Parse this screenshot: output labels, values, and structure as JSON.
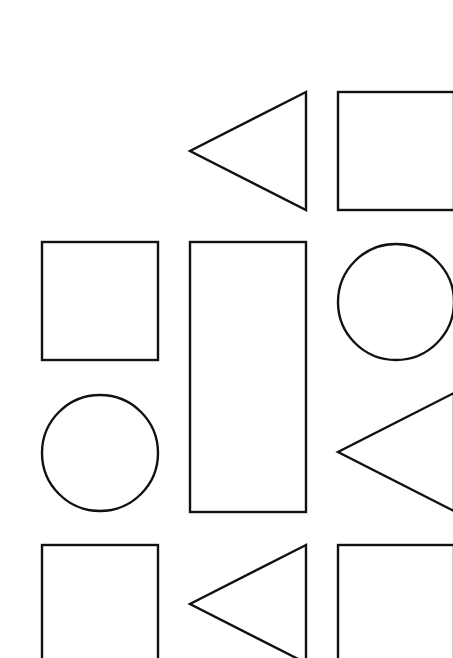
{
  "diagram": {
    "stroke_color": "#111111",
    "background_color": "#ffffff",
    "shapes": [
      {
        "id": "r1c2",
        "type": "triangle",
        "orientation": "pointing-left",
        "row": 1,
        "col": 2
      },
      {
        "id": "r1c3",
        "type": "square",
        "row": 1,
        "col": 3
      },
      {
        "id": "r2c1",
        "type": "square",
        "row": 2,
        "col": 1
      },
      {
        "id": "r2c2",
        "type": "tall-rectangle",
        "row": 2,
        "col": 2,
        "row_span": 2
      },
      {
        "id": "r2c3",
        "type": "circle",
        "row": 2,
        "col": 3
      },
      {
        "id": "r3c1",
        "type": "circle",
        "row": 3,
        "col": 1
      },
      {
        "id": "r3c3",
        "type": "triangle",
        "orientation": "pointing-left",
        "row": 3,
        "col": 3
      },
      {
        "id": "r4c1",
        "type": "square",
        "row": 4,
        "col": 1,
        "clipped": true
      },
      {
        "id": "r4c2",
        "type": "triangle",
        "orientation": "pointing-left",
        "row": 4,
        "col": 2,
        "clipped": true
      },
      {
        "id": "r4c3",
        "type": "square",
        "row": 4,
        "col": 3,
        "clipped": true
      }
    ]
  }
}
